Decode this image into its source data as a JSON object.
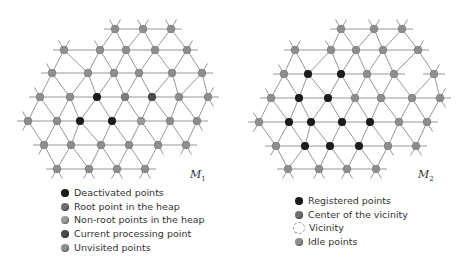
{
  "colors": {
    "edge": "#8a8a8a",
    "black": "#1c1c1c",
    "dark": "#4a4a4a",
    "gray": "#7d7d7d",
    "light": "#9a9a9a",
    "unvisited": "#8e8e8e"
  },
  "meshes": [
    {
      "id": "M1",
      "label_main": "M",
      "label_sub": "1",
      "label_pos": [
        190,
        168
      ],
      "nodes": [
        [
          115,
          29,
          "u"
        ],
        [
          143,
          29,
          "u"
        ],
        [
          171,
          29,
          "u"
        ],
        [
          64,
          50,
          "u"
        ],
        [
          100,
          50,
          "u"
        ],
        [
          126,
          50,
          "u"
        ],
        [
          155,
          50,
          "u"
        ],
        [
          187,
          50,
          "u"
        ],
        [
          52,
          73,
          "u"
        ],
        [
          88,
          73,
          "u"
        ],
        [
          114,
          73,
          "u"
        ],
        [
          139,
          73,
          "u"
        ],
        [
          172,
          73,
          "u"
        ],
        [
          202,
          73,
          "u"
        ],
        [
          40,
          97,
          "u"
        ],
        [
          70,
          97,
          "u"
        ],
        [
          97,
          97,
          "b"
        ],
        [
          125,
          97,
          "g"
        ],
        [
          152,
          97,
          "d"
        ],
        [
          179,
          97,
          "u"
        ],
        [
          208,
          97,
          "u"
        ],
        [
          28,
          121,
          "u"
        ],
        [
          57,
          121,
          "u"
        ],
        [
          80,
          121,
          "b"
        ],
        [
          112,
          121,
          "b"
        ],
        [
          141,
          121,
          "l"
        ],
        [
          170,
          121,
          "u"
        ],
        [
          197,
          121,
          "u"
        ],
        [
          44,
          145,
          "u"
        ],
        [
          71,
          145,
          "u"
        ],
        [
          101,
          145,
          "u"
        ],
        [
          129,
          145,
          "u"
        ],
        [
          158,
          145,
          "u"
        ],
        [
          186,
          145,
          "u"
        ],
        [
          57,
          169,
          "u"
        ],
        [
          89,
          169,
          "u"
        ],
        [
          117,
          169,
          "u"
        ],
        [
          145,
          169,
          "u"
        ]
      ]
    },
    {
      "id": "M2",
      "label_main": "M",
      "label_sub": "2",
      "label_pos": [
        418,
        168
      ],
      "nodes": [
        [
          341,
          29,
          "u"
        ],
        [
          374,
          29,
          "u"
        ],
        [
          402,
          29,
          "u"
        ],
        [
          295,
          50,
          "u"
        ],
        [
          331,
          50,
          "u"
        ],
        [
          356,
          50,
          "u"
        ],
        [
          383,
          50,
          "u"
        ],
        [
          418,
          50,
          "u"
        ],
        [
          284,
          74,
          "u"
        ],
        [
          308,
          74,
          "b"
        ],
        [
          341,
          74,
          "b"
        ],
        [
          367,
          74,
          "u"
        ],
        [
          394,
          74,
          "u"
        ],
        [
          434,
          74,
          "u"
        ],
        [
          271,
          98,
          "u"
        ],
        [
          299,
          98,
          "b"
        ],
        [
          328,
          98,
          "b"
        ],
        [
          355,
          98,
          "u"
        ],
        [
          381,
          98,
          "u"
        ],
        [
          412,
          98,
          "u"
        ],
        [
          440,
          98,
          "u"
        ],
        [
          259,
          122,
          "u"
        ],
        [
          289,
          122,
          "b"
        ],
        [
          311,
          122,
          "b"
        ],
        [
          342,
          122,
          "b"
        ],
        [
          370,
          122,
          "b"
        ],
        [
          399,
          122,
          "u"
        ],
        [
          427,
          122,
          "u"
        ],
        [
          276,
          146,
          "u"
        ],
        [
          305,
          146,
          "b"
        ],
        [
          330,
          146,
          "b"
        ],
        [
          359,
          146,
          "b"
        ],
        [
          388,
          146,
          "u"
        ],
        [
          416,
          146,
          "u"
        ],
        [
          288,
          169,
          "u"
        ],
        [
          319,
          169,
          "u"
        ],
        [
          347,
          169,
          "u"
        ],
        [
          376,
          169,
          "u"
        ]
      ]
    }
  ],
  "legend_left": {
    "items": [
      {
        "label": "Deactivated points",
        "color": "#1c1c1c"
      },
      {
        "label": "Root point in the heap",
        "color": "#6e6e6e"
      },
      {
        "label": "Non-root points in the heap",
        "color": "#9a9a9a"
      },
      {
        "label": "Current processing point",
        "color": "#4a4a4a"
      },
      {
        "label": "Unvisited points",
        "color": "#8e8e8e"
      }
    ]
  },
  "legend_right": {
    "items": [
      {
        "label": "Registered points",
        "color": "#1c1c1c",
        "style": "solid"
      },
      {
        "label": "Center of the vicinity",
        "color": "#6e6e6e",
        "style": "solid"
      },
      {
        "label": "Vicinity",
        "color": "",
        "style": "dashed"
      },
      {
        "label": "Idle points",
        "color": "#8e8e8e",
        "style": "solid"
      }
    ]
  }
}
